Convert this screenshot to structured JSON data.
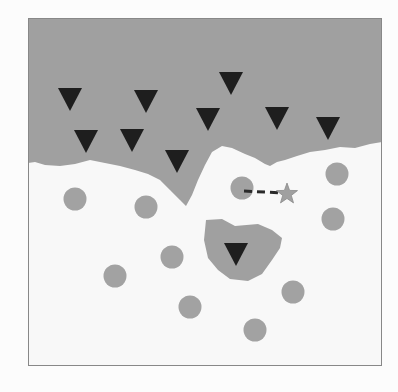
{
  "diagram": {
    "type": "decision-boundary",
    "frame": {
      "x": 28,
      "y": 18,
      "width": 154,
      "height": 165,
      "right": 182,
      "bottom": 183
    },
    "colors": {
      "background": "#fcfcfc",
      "region_class_a": "#a0a0a0",
      "region_class_b": "#f8f8f8",
      "triangle": "#1e1e1e",
      "circle": "#a2a2a2",
      "star": "#a0a0a0",
      "dashed_line": "#2a2a2a",
      "frame": "#888888"
    },
    "triangles": [
      {
        "x": 70,
        "y": 98
      },
      {
        "x": 146,
        "y": 100
      },
      {
        "x": 86,
        "y": 140
      },
      {
        "x": 132,
        "y": 139
      },
      {
        "x": 177,
        "y": 160
      },
      {
        "x": 231,
        "y": 82
      },
      {
        "x": 208,
        "y": 118
      },
      {
        "x": 277,
        "y": 117
      },
      {
        "x": 328,
        "y": 127
      },
      {
        "x": 236,
        "y": 253
      }
    ],
    "circles": [
      {
        "x": 75,
        "y": 199
      },
      {
        "x": 146,
        "y": 207
      },
      {
        "x": 242,
        "y": 188
      },
      {
        "x": 337,
        "y": 174
      },
      {
        "x": 172,
        "y": 257
      },
      {
        "x": 333,
        "y": 219
      },
      {
        "x": 115,
        "y": 276
      },
      {
        "x": 293,
        "y": 292
      },
      {
        "x": 190,
        "y": 307
      },
      {
        "x": 255,
        "y": 330
      }
    ],
    "star": {
      "x": 287,
      "y": 194
    },
    "dashed_link": {
      "from": {
        "x": 244,
        "y": 191
      },
      "to": {
        "x": 283,
        "y": 193
      }
    }
  }
}
